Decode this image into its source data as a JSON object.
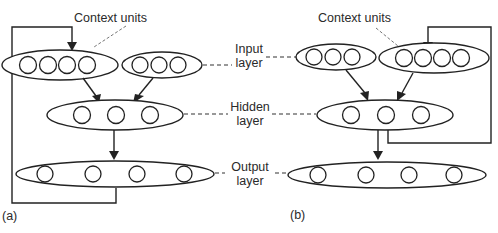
{
  "diagram": {
    "type": "recurrent-neural-network-architectures",
    "panels": [
      {
        "id": "a",
        "label": "(a)",
        "context_label": "Context units",
        "layers": {
          "context_units": 4,
          "input_units": 3,
          "hidden_units": 3,
          "output_units": 4
        },
        "feedback": "output layer to context units"
      },
      {
        "id": "b",
        "label": "(b)",
        "context_label": "Context units",
        "layers": {
          "context_units": 4,
          "input_units": 3,
          "hidden_units": 3,
          "output_units": 4
        },
        "feedback": "hidden layer to context units"
      }
    ],
    "layer_labels": {
      "input": [
        "Input",
        "layer"
      ],
      "hidden": [
        "Hidden",
        "layer"
      ],
      "output": [
        "Output",
        "layer"
      ]
    },
    "colors": {
      "stroke": "#222222",
      "background": "#ffffff",
      "text": "#2a2a2a"
    }
  }
}
